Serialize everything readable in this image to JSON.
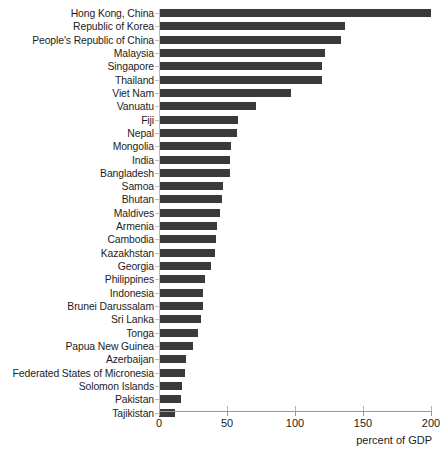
{
  "chart_data": {
    "type": "bar",
    "orientation": "horizontal",
    "title": "",
    "subtitle": "",
    "xlabel": "percent of GDP",
    "ylabel": "",
    "xlim": [
      0,
      200
    ],
    "ylim": null,
    "grid": false,
    "legend": null,
    "xticks": [
      0,
      50,
      100,
      150,
      200
    ],
    "xtick_labels": [
      "0",
      "50",
      "100",
      "150",
      "200"
    ],
    "bar_color": "#3a3a3a",
    "axis_color": "#9a9a9a",
    "categories": [
      "Hong Kong, China",
      "Republic of Korea",
      "People's Republic of China",
      "Malaysia",
      "Singapore",
      "Thailand",
      "Viet Nam",
      "Vanuatu",
      "Fiji",
      "Nepal",
      "Mongolia",
      "India",
      "Bangladesh",
      "Samoa",
      "Bhutan",
      "Maldives",
      "Armenia",
      "Cambodia",
      "Kazakhstan",
      "Georgia",
      "Philippines",
      "Indonesia",
      "Brunei Darussalam",
      "Sri Lanka",
      "Tonga",
      "Papua New Guinea",
      "Azerbaijan",
      "Federated States of Micronesia",
      "Solomon Islands",
      "Pakistan",
      "Tajikistan"
    ],
    "values": [
      200,
      137,
      134,
      122,
      120,
      120,
      97,
      71,
      58,
      57,
      53,
      52,
      52,
      47,
      46,
      45,
      43,
      42,
      41,
      38,
      34,
      32,
      32,
      31,
      29,
      25,
      20,
      19,
      17,
      16,
      12
    ]
  }
}
